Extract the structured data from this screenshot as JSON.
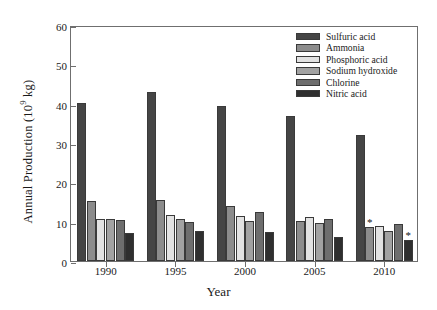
{
  "chart_data": {
    "type": "bar",
    "title": "",
    "xlabel": "Year",
    "ylabel": "Annual Production (10⁹ kg)",
    "ylabel_prefix": "Annual Production (10",
    "ylabel_exponent": "9",
    "ylabel_suffix": " kg)",
    "categories": [
      "1990",
      "1995",
      "2000",
      "2005",
      "2010"
    ],
    "ylim": [
      0,
      60
    ],
    "yticks": [
      0,
      10,
      20,
      30,
      40,
      50,
      60
    ],
    "grid": false,
    "legend_position": "upper right",
    "series": [
      {
        "name": "Sulfuric acid",
        "color": "#454545",
        "values": [
          40.2,
          43.0,
          39.4,
          36.8,
          32.0
        ]
      },
      {
        "name": "Ammonia",
        "color": "#8c8c8c",
        "values": [
          15.2,
          15.6,
          14.1,
          10.2,
          8.6
        ]
      },
      {
        "name": "Phosphoric acid",
        "color": "#e2e2e2",
        "values": [
          10.8,
          11.8,
          11.4,
          11.2,
          9.0
        ]
      },
      {
        "name": "Sodium hydroxide",
        "color": "#a2a2a2",
        "values": [
          10.6,
          10.8,
          10.3,
          9.6,
          7.6
        ]
      },
      {
        "name": "Chlorine",
        "color": "#6e6e6e",
        "values": [
          10.5,
          10.0,
          12.4,
          10.6,
          9.4
        ]
      },
      {
        "name": "Nitric acid",
        "color": "#2f2f2f",
        "values": [
          7.1,
          7.6,
          7.5,
          6.2,
          5.4
        ]
      }
    ],
    "annotations": [
      {
        "label": "*",
        "category": "2010",
        "series": "Ammonia",
        "value": 8.6
      },
      {
        "label": "*",
        "category": "2010",
        "series": "Nitric acid",
        "value": 5.4
      }
    ]
  },
  "legend": {
    "items": [
      {
        "label": "Sulfuric acid"
      },
      {
        "label": "Ammonia"
      },
      {
        "label": "Phosphoric acid"
      },
      {
        "label": "Sodium hydroxide"
      },
      {
        "label": "Chlorine"
      },
      {
        "label": "Nitric acid"
      }
    ]
  }
}
